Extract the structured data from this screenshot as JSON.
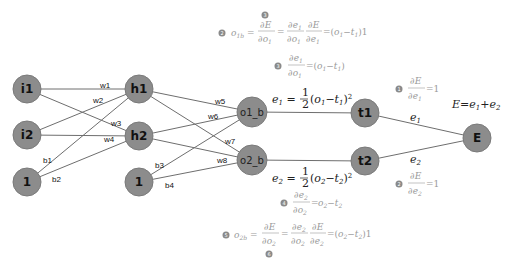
{
  "diagram": {
    "type": "neural-network-backprop",
    "nodes": {
      "i1": "i1",
      "i2": "i2",
      "bias1": "1",
      "h1": "h1",
      "h2": "h2",
      "bias2": "1",
      "o1": "o1_b",
      "o2": "o2_b",
      "t1": "t1",
      "t2": "t2",
      "E": "E"
    },
    "weights": {
      "w1": "w1",
      "w2": "w2",
      "w3": "w3",
      "w4": "w4",
      "w5": "w5",
      "w6": "w6",
      "w7": "w7",
      "w8": "w8",
      "b1": "b1",
      "b2": "b2",
      "b3": "b3",
      "b4": "b4"
    },
    "edge_labels": {
      "e1": "e",
      "e1_sub": "1",
      "e2": "e",
      "e2_sub": "2"
    },
    "equations": {
      "total_error": "E = e₁ + e₂",
      "e1_def": "e₁ = ½(o₁ − t₁)²",
      "e2_def": "e₂ = ½(o₂ − t₂)²",
      "dE_de1": "∂E/∂e₁ = 1",
      "dE_de2": "∂E/∂e₂ = 1",
      "de1_do1": "∂e₁/∂o₁ = (o₁ − t₁)",
      "de2_do2": "∂e₂/∂o₂ = o₂ − t₂",
      "o1b": "o₁ᵦ = ∂E/∂o₁ = ∂e₁/∂o₁ · ∂E/∂e₁ = (o₁ − t₁)1",
      "o2b": "o₂ᵦ = ∂E/∂o₂ = ∂e₂/∂o₂ · ∂E/∂e₂ = (o₂ − t₂)1"
    },
    "badges": {
      "top": "3",
      "o1b": "2",
      "de1_do1": "3",
      "dE_de1": "1",
      "dE_de2": "2",
      "de2_do2": "4",
      "o2b": "5",
      "bottom": "6"
    },
    "colors": {
      "node_fill": "#8c8c8c",
      "edge": "#6e6e6e",
      "faint_math": "#9a9a9a",
      "dark_math": "#222222"
    }
  }
}
